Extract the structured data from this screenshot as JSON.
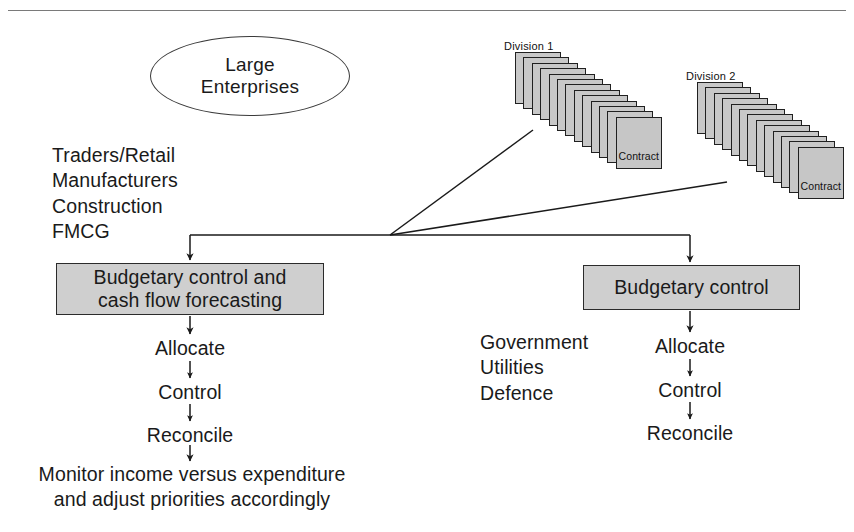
{
  "diagram": {
    "title_oval": {
      "line1": "Large",
      "line2": "Enterprises"
    },
    "top_rule": {
      "color": "#7a7a7a"
    },
    "colors": {
      "box_fill": "#cfcfcf",
      "card_fill": "#c8c8c8",
      "stroke": "#202020",
      "text": "#1a1a1a"
    },
    "sector_list_left": [
      "Traders/Retail",
      "Manufacturers",
      "Construction",
      "FMCG"
    ],
    "sector_list_right": [
      "Government",
      "Utilities",
      "Defence"
    ],
    "process_box_left": {
      "line1": "Budgetary control and",
      "line2": "cash flow forecasting"
    },
    "process_box_right": {
      "line1": "Budgetary control"
    },
    "flow_left": [
      "Allocate",
      "Control",
      "Reconcile"
    ],
    "flow_right": [
      "Allocate",
      "Control",
      "Reconcile"
    ],
    "conclusion": {
      "line1": "Monitor income versus expenditure",
      "line2": "and adjust priorities accordingly"
    },
    "stacks": [
      {
        "label": "Division 1",
        "front_label": "Contract",
        "card_count": 13
      },
      {
        "label": "Division 2",
        "front_label": "Contract",
        "card_count": 13
      }
    ]
  }
}
